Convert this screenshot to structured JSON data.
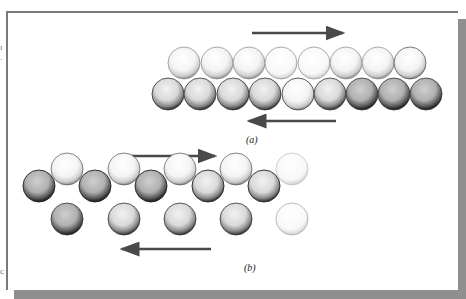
{
  "figure": {
    "type": "diagram",
    "panels": [
      {
        "id": "a",
        "label": "(a)",
        "arrows": [
          {
            "direction": "right",
            "x1": 252,
            "x2": 343,
            "y": 33
          },
          {
            "direction": "left",
            "x1": 249,
            "x2": 336,
            "y": 121
          }
        ],
        "rows": [
          {
            "name": "top-row",
            "count": 8,
            "shade": "light"
          },
          {
            "name": "bottom-row",
            "count": 9,
            "shade": "medium-dark"
          }
        ]
      },
      {
        "id": "b",
        "label": "(b)",
        "arrows": [
          {
            "direction": "right",
            "x1": 127,
            "x2": 215,
            "y": 156
          },
          {
            "direction": "left",
            "x1": 122,
            "x2": 211,
            "y": 249
          }
        ],
        "rows": [
          {
            "name": "upper-row",
            "count": 5,
            "shade": "light"
          },
          {
            "name": "middle-row",
            "count": 5,
            "shade": "gray-dark"
          },
          {
            "name": "lower-row",
            "count": 5,
            "shade": "gray"
          }
        ]
      }
    ],
    "colors": {
      "arrow": "#4a4a4a",
      "frame_border": "#7a7a7a",
      "shadow": "#8f8f8f"
    }
  },
  "margin": {
    "left_top_mark": "ı",
    "left_top_mark2": "·",
    "left_bottom_mark": "c"
  }
}
